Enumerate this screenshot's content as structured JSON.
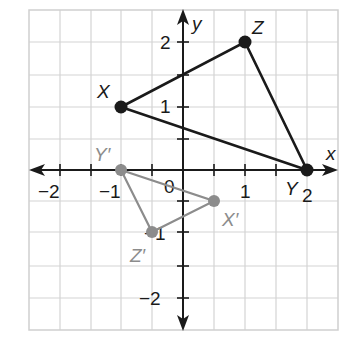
{
  "figure": {
    "x_axis_label": "x",
    "y_axis_label": "y",
    "origin_label": "0",
    "x_ticks": [
      {
        "value": -2,
        "label": "−2"
      },
      {
        "value": -1,
        "label": "−1"
      },
      {
        "value": 1,
        "label": "1"
      },
      {
        "value": 2,
        "label": "2"
      }
    ],
    "y_ticks": [
      {
        "value": 2,
        "label": "2"
      },
      {
        "value": 1,
        "label": "1"
      },
      {
        "value": -1,
        "label": "−1"
      },
      {
        "value": -2,
        "label": "−2"
      }
    ],
    "original_triangle": {
      "color": "#1a1a1a",
      "vertices": [
        {
          "name": "X",
          "label": "X",
          "x": -1,
          "y": 1
        },
        {
          "name": "Y",
          "label": "Y",
          "x": 2,
          "y": 0
        },
        {
          "name": "Z",
          "label": "Z",
          "x": 1,
          "y": 2
        }
      ]
    },
    "image_triangle": {
      "color": "#8c8c8c",
      "vertices": [
        {
          "name": "X'",
          "label": "X′",
          "x": 0.5,
          "y": -0.5
        },
        {
          "name": "Y'",
          "label": "Y′",
          "x": -1,
          "y": 0
        },
        {
          "name": "Z'",
          "label": "Z′",
          "x": -0.5,
          "y": -1
        }
      ]
    },
    "grid": {
      "x_range": [
        -2.5,
        2.5
      ],
      "y_range": [
        -2.5,
        2.5
      ],
      "minor_step": 0.5
    }
  }
}
